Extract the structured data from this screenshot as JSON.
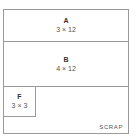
{
  "diagram": {
    "pieces": [
      {
        "id": "A",
        "label": "A",
        "dims": "3 × 12"
      },
      {
        "id": "B",
        "label": "B",
        "dims": "4 × 12"
      },
      {
        "id": "F",
        "label": "F",
        "dims": "3 × 3"
      }
    ],
    "scrap_label": "SCRAP",
    "colors": {
      "border": "#9a9a9a",
      "text": "#444444",
      "background": "#ffffff"
    }
  }
}
